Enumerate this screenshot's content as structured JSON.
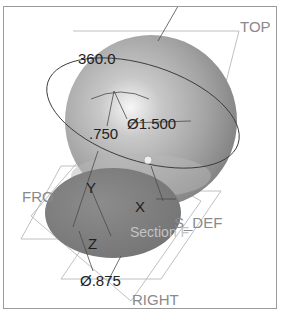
{
  "viewport": {
    "background": "#ffffff",
    "border_color": "#9a9a9a",
    "model": {
      "type": "sphere-with-cut",
      "sphere_color": "#9c9c9c",
      "highlight_color": "#f4f4f4",
      "cut_face_color": "#7e7e7e"
    },
    "datum_planes": {
      "top": "TOP",
      "front": "FRO",
      "right": "RIGHT",
      "csys": "S_DEF"
    },
    "axes": {
      "x": "X",
      "y": "Y",
      "z": "Z"
    },
    "dimensions": {
      "angle": "360.0",
      "offset": ".750",
      "sphere_diameter": "Ø1.500",
      "cut_diameter": "Ø.875"
    },
    "section_label": "Section F",
    "colors": {
      "datum_text": "#8a8a8a",
      "dimension_text": "#222222",
      "datum_lines": "#a8a8a8",
      "sketch_lines": "#3a3a3a"
    }
  }
}
